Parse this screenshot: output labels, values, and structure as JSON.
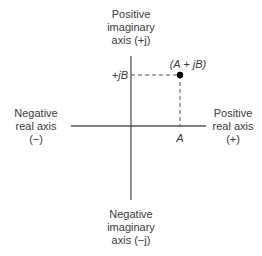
{
  "diagram": {
    "type": "complex-plane",
    "labels": {
      "positive_imaginary": [
        "Positive",
        "imaginary",
        "axis (+j)"
      ],
      "negative_imaginary": [
        "Negative",
        "imaginary",
        "axis (−j)"
      ],
      "negative_real": [
        "Negative",
        "real axis",
        "(−)"
      ],
      "positive_real": [
        "Positive",
        "real axis",
        "(+)"
      ],
      "point": "(A + jB)",
      "real_component": "A",
      "imag_component": "+jB"
    },
    "colors": {
      "axis": "#555555",
      "dashed": "#555555",
      "point": "#000000",
      "text": "#3a3a3a"
    },
    "geometry": {
      "origin": [
        131,
        126
      ],
      "point": [
        180,
        75
      ]
    }
  }
}
